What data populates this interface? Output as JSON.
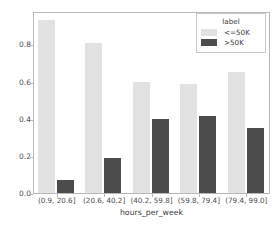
{
  "chart_data": {
    "type": "bar",
    "title": "",
    "xlabel": "hours_per_week",
    "ylabel": "",
    "categories": [
      "(0.9, 20.6]",
      "(20.6, 40.2]",
      "(40.2, 59.8]",
      "(59.8, 79.4]",
      "(79.4, 99.0]"
    ],
    "series": [
      {
        "name": "<=50K",
        "color": "#e2e2e2",
        "values": [
          0.93,
          0.81,
          0.6,
          0.585,
          0.65
        ]
      },
      {
        "name": ">50K",
        "color": "#4c4c4c",
        "values": [
          0.07,
          0.19,
          0.4,
          0.415,
          0.35
        ]
      }
    ],
    "legend": {
      "title": "label",
      "position": "upper right"
    },
    "ylim": [
      0.0,
      0.98
    ],
    "yticks": [
      "0.0",
      "0.2",
      "0.4",
      "0.6",
      "0.8"
    ],
    "ytick_values": [
      0.0,
      0.2,
      0.4,
      0.6,
      0.8
    ],
    "grid": false
  }
}
